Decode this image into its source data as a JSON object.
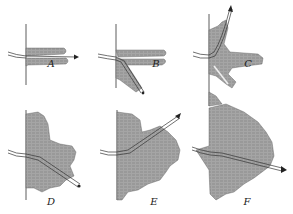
{
  "figure": {
    "panels": [
      {
        "id": "A",
        "label": "A",
        "label_pos": [
          51,
          58
        ]
      },
      {
        "id": "B",
        "label": "B",
        "label_pos": [
          156,
          58
        ]
      },
      {
        "id": "C",
        "label": "C",
        "label_pos": [
          248,
          58
        ]
      },
      {
        "id": "D",
        "label": "D",
        "label_pos": [
          51,
          204
        ]
      },
      {
        "id": "E",
        "label": "E",
        "label_pos": [
          154,
          204
        ]
      },
      {
        "id": "F",
        "label": "F",
        "label_pos": [
          247,
          204
        ]
      }
    ],
    "colors": {
      "fill": "#9a9a9a",
      "line": "#333333",
      "background": "#ffffff"
    }
  }
}
